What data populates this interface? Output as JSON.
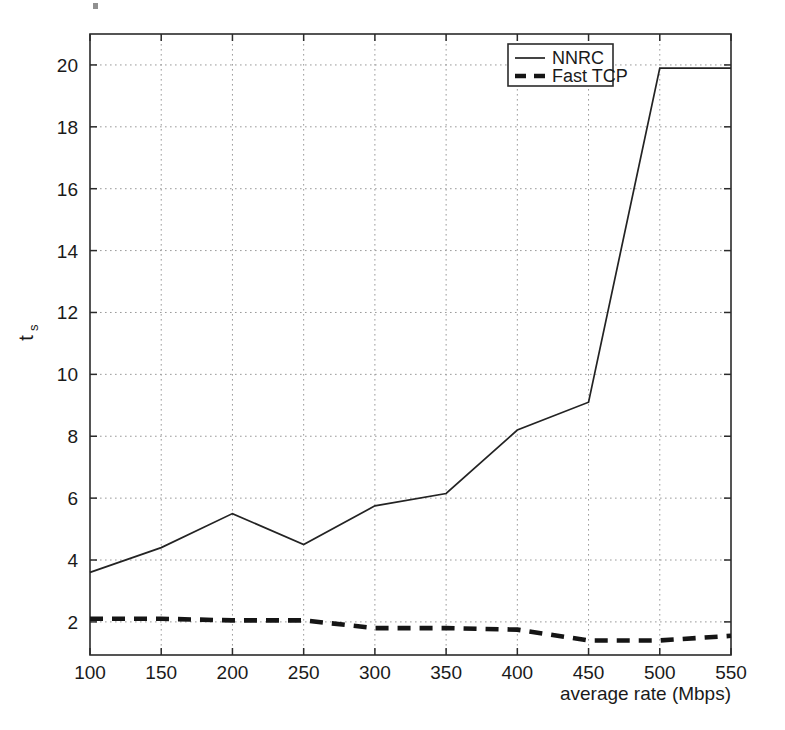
{
  "chart_data": {
    "type": "line",
    "title": "",
    "subtitle": "",
    "xlabel": "average rate (Mbps)",
    "ylabel": "t",
    "ylabel_subscript": "s",
    "x": [
      100,
      150,
      200,
      250,
      300,
      350,
      400,
      450,
      500,
      550
    ],
    "xlim": [
      100,
      550
    ],
    "ylim": [
      0.93,
      21.0
    ],
    "xticks": [
      100,
      150,
      200,
      250,
      300,
      350,
      400,
      450,
      500,
      550
    ],
    "xtick_labels": [
      "100",
      "150",
      "200",
      "250",
      "300",
      "350",
      "400",
      "450",
      "500",
      "550"
    ],
    "yticks": [
      2,
      4,
      6,
      8,
      10,
      12,
      14,
      16,
      18,
      20
    ],
    "ytick_labels": [
      "2",
      "4",
      "6",
      "8",
      "10",
      "12",
      "14",
      "16",
      "18",
      "20"
    ],
    "grid": true,
    "grid_style": "dotted",
    "legend_position": "top-right",
    "series": [
      {
        "name": "NNRC",
        "style": "solid",
        "color": "#232323",
        "values": [
          3.6,
          4.4,
          5.5,
          4.5,
          5.75,
          6.15,
          8.2,
          9.1,
          19.9,
          19.9
        ]
      },
      {
        "name": "Fast TCP",
        "style": "dashed",
        "color": "#151515",
        "values": [
          2.1,
          2.1,
          2.05,
          2.05,
          1.8,
          1.8,
          1.75,
          1.4,
          1.4,
          1.55
        ]
      }
    ]
  },
  "axes": {
    "x_axis_name": "average rate (Mbps)",
    "y_axis_name": "ts"
  },
  "legend": {
    "entries": [
      {
        "label": "NNRC",
        "style": "solid"
      },
      {
        "label": "Fast TCP",
        "style": "dashed"
      }
    ]
  }
}
